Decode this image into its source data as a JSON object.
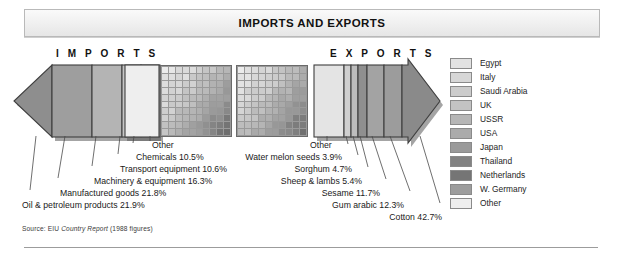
{
  "title": "IMPORTS AND EXPORTS",
  "headings": {
    "imports": "I M P O R T S",
    "exports": "E X P O R T S"
  },
  "source": {
    "label": "Source:",
    "org": "EIU",
    "publication": "Country Report",
    "note": "(1988 figures)",
    "full": "Source: EIU Country Report (1988 figures)"
  },
  "legend": {
    "items": [
      {
        "label": "Egypt",
        "color": "#e2e2e2"
      },
      {
        "label": "Italy",
        "color": "#d7d7d7"
      },
      {
        "label": "Saudi Arabia",
        "color": "#cccccc"
      },
      {
        "label": "UK",
        "color": "#c3c3c3"
      },
      {
        "label": "USSR",
        "color": "#b6b6b6"
      },
      {
        "label": "USA",
        "color": "#ababab"
      },
      {
        "label": "Japan",
        "color": "#9a9a9a"
      },
      {
        "label": "Thailand",
        "color": "#828282"
      },
      {
        "label": "Netherlands",
        "color": "#757575"
      },
      {
        "label": "W. Germany",
        "color": "#9d9d9d"
      },
      {
        "label": "Other",
        "color": "#eeeeee"
      }
    ]
  },
  "chart_data": {
    "type": "bar",
    "title": "IMPORTS AND EXPORTS",
    "xlabel": "",
    "ylabel": "",
    "units": "percent of total",
    "charts": [
      {
        "name": "Imports",
        "heading": "I M P O R T S",
        "direction": "left",
        "categories": [
          "Oil & petroleum products",
          "Manufactured goods",
          "Machinery & equipment",
          "Transport equipment",
          "Chemicals",
          "Other"
        ],
        "values": [
          21.9,
          21.8,
          16.3,
          10.6,
          10.5,
          18.9
        ],
        "labels": [
          "Oil & petroleum products 21.9%",
          "Manufactured goods 21.8%",
          "Machinery & equipment 16.3%",
          "Transport equipment 10.6%",
          "Chemicals 10.5%",
          "Other"
        ],
        "colors": [
          "#8e8e8e",
          "#9e9e9e",
          "#b4b4b4",
          "#c6c6c6",
          "#d6d6d6",
          "#ececec"
        ]
      },
      {
        "name": "Exports",
        "heading": "E X P O R T S",
        "direction": "right",
        "categories": [
          "Other",
          "Water melon seeds",
          "Sorghum",
          "Sheep & lambs",
          "Sesame",
          "Gum arabic",
          "Cotton"
        ],
        "values": [
          19.3,
          3.9,
          4.7,
          5.4,
          11.7,
          12.3,
          42.7
        ],
        "labels": [
          "Other",
          "Water melon seeds 3.9%",
          "Sorghum 4.7%",
          "Sheep & lambs 5.4%",
          "Sesame 11.7%",
          "Gum arabic 12.3%",
          "Cotton 42.7%"
        ],
        "colors": [
          "#e4e4e4",
          "#cfcfcf",
          "#bdbdbd",
          "#a3a3a3",
          "#9c9c9c",
          "#8f8f8f",
          "#8a8a8a"
        ]
      }
    ],
    "waffles": [
      {
        "name": "imports-partners-grid",
        "rows": 10,
        "cols": 10
      },
      {
        "name": "exports-partners-grid",
        "rows": 10,
        "cols": 10
      }
    ],
    "legend_position": "right",
    "grid": false
  }
}
